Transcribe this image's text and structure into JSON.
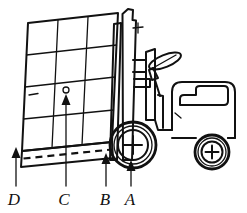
{
  "figure": {
    "background_color": "#ffffff",
    "line_color": "#111111",
    "width": 247,
    "height": 213
  },
  "callouts": [
    {
      "id": "D",
      "label": "D",
      "meaning": "load-overhang-outer-edge",
      "label_x": 14,
      "label_y": 205,
      "tip_x": 16,
      "tip_y": 148,
      "tail_y": 186,
      "arrowhead": "up"
    },
    {
      "id": "C",
      "label": "C",
      "meaning": "load-center-of-gravity",
      "label_x": 64,
      "label_y": 205,
      "tip_x": 66,
      "tip_y": 95,
      "tail_y": 186,
      "arrowhead": "up"
    },
    {
      "id": "B",
      "label": "B",
      "meaning": "mast-front-face",
      "label_x": 105,
      "label_y": 205,
      "tip_x": 106,
      "tip_y": 154,
      "tail_y": 186,
      "arrowhead": "up"
    },
    {
      "id": "A",
      "label": "A",
      "meaning": "front-axle-centerline",
      "label_x": 130,
      "label_y": 205,
      "tip_x": 131,
      "tip_y": 161,
      "tail_y": 186,
      "arrowhead": "up"
    }
  ],
  "load": {
    "name": "palletized-load",
    "grid_columns": 3,
    "grid_rows": 4,
    "tilt": "leaning-back-toward-mast",
    "cog_marker": {
      "shape": "small-circle",
      "x": 66,
      "y": 90,
      "r": 3
    },
    "pallet": {
      "has_dashed_fork_line": true
    }
  },
  "truck": {
    "name": "forklift-truck",
    "parts": [
      {
        "id": "mast",
        "label": "mast"
      },
      {
        "id": "carriage",
        "label": "carriage-bracket"
      },
      {
        "id": "steering-wheel",
        "label": "steering-wheel"
      },
      {
        "id": "operator-seat",
        "label": "operator-seat"
      },
      {
        "id": "counterweight-body",
        "label": "counterweight-body"
      },
      {
        "id": "front-wheel",
        "label": "front-wheel"
      },
      {
        "id": "rear-wheel",
        "label": "rear-wheel"
      }
    ],
    "front_wheel": {
      "cx": 133,
      "cy": 145,
      "r_outer": 23,
      "r_mid": 19,
      "r_inner": 15
    },
    "rear_wheel": {
      "cx": 212,
      "cy": 152,
      "r_outer": 17,
      "r_mid": 14,
      "r_inner": 10.5
    }
  }
}
